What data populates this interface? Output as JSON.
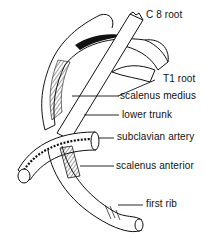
{
  "diagram": {
    "labels": {
      "c8_root": "C 8 root",
      "t1_root": "T1 root",
      "scalenus_medius": "scalenus medius",
      "lower_trunk": "lower trunk",
      "subclavian_artery": "subclavian artery",
      "scalenus_anterior": "scalenus anterior",
      "first_rib": "first rib"
    },
    "colors": {
      "ink": "#111111",
      "background": "#ffffff"
    }
  }
}
